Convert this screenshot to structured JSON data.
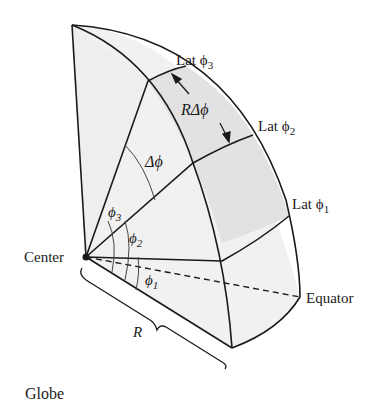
{
  "caption": "Globe",
  "labels": {
    "center": "Center",
    "equator": "Equator",
    "radius": "R",
    "delta_phi": "Δϕ",
    "arc_length": "RΔϕ",
    "lat1": "Lat ϕ",
    "lat1_sub": "1",
    "lat2": "Lat ϕ",
    "lat2_sub": "2",
    "lat3": "Lat ϕ",
    "lat3_sub": "3",
    "phi1": "ϕ",
    "phi1_sub": "1",
    "phi2": "ϕ",
    "phi2_sub": "2",
    "phi3": "ϕ",
    "phi3_sub": "3"
  },
  "colors": {
    "stroke": "#1a1a1a",
    "fill_light": "#f1f1f1",
    "fill_shaded": "#e2e2e2",
    "fill_wedge": "#e8e8e8"
  }
}
